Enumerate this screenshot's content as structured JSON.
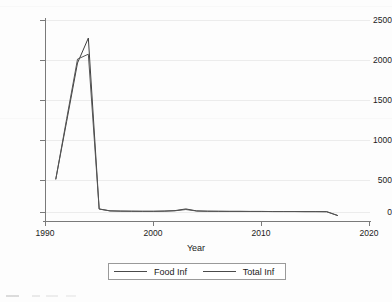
{
  "chart_data": {
    "type": "line",
    "title": "",
    "xlabel": "Year",
    "ylabel": "",
    "xlim": [
      1990,
      2020
    ],
    "ylim": [
      0,
      2500
    ],
    "xticks": [
      1990,
      2000,
      2010,
      2020
    ],
    "yticks": [
      0,
      500,
      1000,
      1500,
      2000,
      2500
    ],
    "xtick_labels": [
      "1990",
      "2000",
      "2010",
      "2020"
    ],
    "ytick_labels": [
      "0",
      "500",
      "1000",
      "1500",
      "2000",
      "2500"
    ],
    "grid": "horizontal",
    "legend_position": "below-axes",
    "x": [
      1991,
      1992,
      1993,
      1994,
      1995,
      1996,
      1997,
      1998,
      1999,
      2000,
      2001,
      2002,
      2003,
      2004,
      2005,
      2006,
      2007,
      2008,
      2009,
      2010,
      2011,
      2012,
      2013,
      2014,
      2015,
      2016,
      2017
    ],
    "series": [
      {
        "name": "Food Inf",
        "color": "#3f3f3f",
        "values": [
          430,
          1180,
          1940,
          2265,
          40,
          15,
          12,
          10,
          9,
          9,
          12,
          18,
          40,
          14,
          10,
          9,
          8,
          8,
          7,
          7,
          6,
          6,
          6,
          5,
          5,
          4,
          -45
        ]
      },
      {
        "name": "Total Inf",
        "color": "#555555",
        "values": [
          430,
          1215,
          1990,
          2055,
          38,
          14,
          11,
          10,
          9,
          9,
          11,
          16,
          32,
          13,
          10,
          9,
          8,
          8,
          7,
          7,
          6,
          6,
          6,
          5,
          5,
          4,
          -45
        ]
      }
    ]
  },
  "legend": {
    "entries": [
      {
        "label": "Food Inf"
      },
      {
        "label": "Total Inf"
      }
    ]
  },
  "axes": {
    "x_title": "Year"
  }
}
